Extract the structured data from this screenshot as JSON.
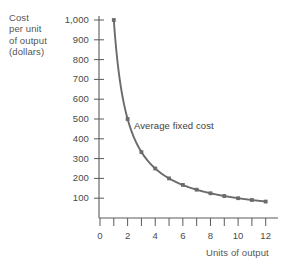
{
  "chart_data": {
    "type": "line",
    "title": "",
    "xlabel": "Units of output",
    "ylabel_lines": [
      "Cost",
      "per unit",
      "of output",
      "(dollars)"
    ],
    "ylabel": "Cost per unit of output (dollars)",
    "annotations": [
      {
        "text": "Average fixed cost",
        "x": 3.4,
        "y": 450
      }
    ],
    "series": [
      {
        "name": "Average fixed cost",
        "marker": "square",
        "color": "#6b6b6b",
        "x": [
          1,
          2,
          3,
          4,
          5,
          6,
          7,
          8,
          9,
          10,
          11,
          12
        ],
        "values": [
          1000,
          500,
          333,
          250,
          200,
          167,
          143,
          125,
          111,
          100,
          91,
          83
        ]
      }
    ],
    "x": [
      1,
      2,
      3,
      4,
      5,
      6,
      7,
      8,
      9,
      10,
      11,
      12
    ],
    "xlim": [
      0,
      12.6
    ],
    "ylim": [
      0,
      1050
    ],
    "xticks": [
      0,
      1,
      2,
      3,
      4,
      5,
      6,
      7,
      8,
      9,
      10,
      11,
      12
    ],
    "yticks": [
      100,
      200,
      300,
      400,
      500,
      600,
      700,
      800,
      900,
      1000
    ],
    "xtick_labels": [
      "0",
      "",
      "2",
      "",
      "4",
      "",
      "6",
      "",
      "8",
      "",
      "10",
      "",
      "12"
    ],
    "ytick_labels": [
      "100",
      "200",
      "300",
      "400",
      "500",
      "600",
      "700",
      "800",
      "900",
      "1,000"
    ],
    "grid": false,
    "legend": "none",
    "axis_color": "#5a5a5a",
    "curve_color": "#6b6b6b",
    "background": "#ffffff"
  }
}
